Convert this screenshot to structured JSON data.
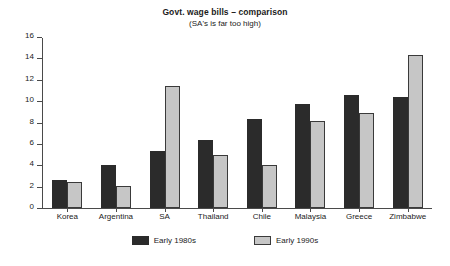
{
  "chart_data": {
    "type": "bar",
    "title": "Govt. wage bills – comparison",
    "subtitle": "(SA's is far too high)",
    "xlabel": "",
    "ylabel": "",
    "ylim": [
      0,
      16
    ],
    "yticks": [
      0,
      2,
      4,
      6,
      8,
      10,
      12,
      14,
      16
    ],
    "grid": false,
    "legend_position": "bottom",
    "categories": [
      "Korea",
      "Argentina",
      "SA",
      "Thailand",
      "Chile",
      "Malaysia",
      "Greece",
      "Zimbabwe"
    ],
    "series": [
      {
        "name": "Early 1980s",
        "color": "#2b2b2b",
        "values": [
          2.6,
          4.0,
          5.3,
          6.4,
          8.3,
          9.7,
          10.6,
          10.4
        ]
      },
      {
        "name": "Early 1990s",
        "color": "#c6c6c6",
        "values": [
          2.4,
          2.1,
          11.4,
          5.0,
          4.0,
          8.1,
          8.9,
          14.3
        ]
      }
    ]
  }
}
